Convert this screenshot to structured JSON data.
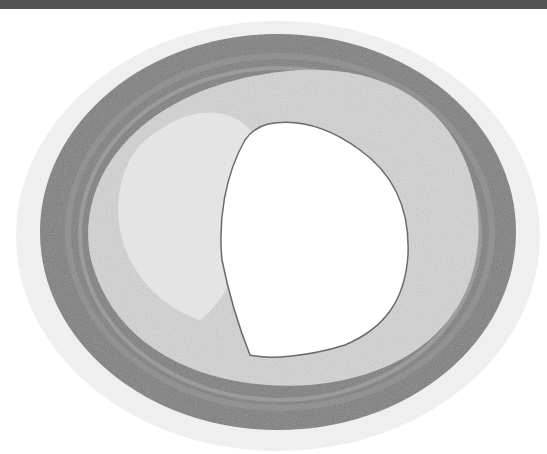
{
  "image": {
    "subject": "artery cross-section histology micrograph",
    "colors": {
      "background": "#ffffff",
      "top_band": "#555555",
      "media": "#7a7a7a",
      "intima": "#d6d6d6",
      "adventitia": "#e6e6e6",
      "lumen": "#ffffff"
    }
  }
}
